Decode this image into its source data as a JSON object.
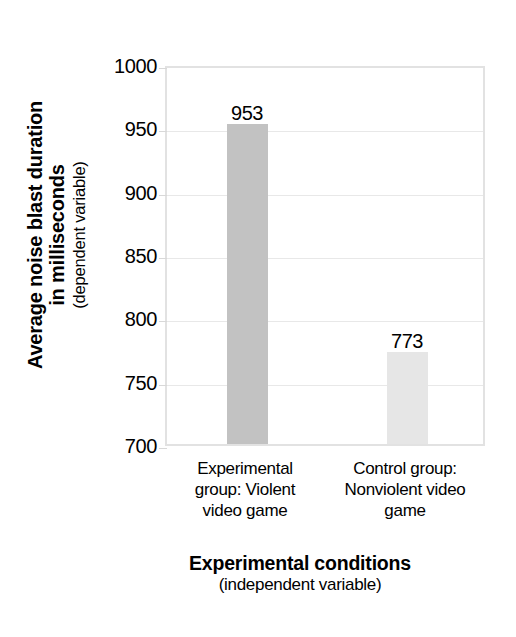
{
  "chart_data": {
    "type": "bar",
    "title": "",
    "categories": [
      "Experimental group: Violent video game",
      "Control group: Nonviolent video game"
    ],
    "category_lines": [
      [
        "Experimental",
        "group: Violent",
        "video game"
      ],
      [
        "Control group:",
        "Nonviolent video",
        "game"
      ]
    ],
    "values": [
      953,
      773
    ],
    "value_labels": [
      "953",
      "773"
    ],
    "bar_colors": [
      "#c2c2c2",
      "#e6e6e6"
    ],
    "xlabel": "Experimental conditions",
    "xlabel_sub": "(independent variable)",
    "ylabel": "Average noise blast duration in milliseconds",
    "ylabel_line1": "Average noise blast duration",
    "ylabel_line2": "in milliseconds",
    "ylabel_sub": "(dependent variable)",
    "ylim": [
      700,
      1000
    ],
    "yticks": [
      1000,
      950,
      900,
      850,
      800,
      750,
      700
    ],
    "ytick_labels": [
      "1000",
      "950",
      "900",
      "850",
      "800",
      "750",
      "700"
    ],
    "grid": true,
    "grid_color": "#e8e8e8",
    "plot_border_color": "#e2e2e2",
    "legend": null,
    "legend_position": "none",
    "units": "milliseconds"
  }
}
